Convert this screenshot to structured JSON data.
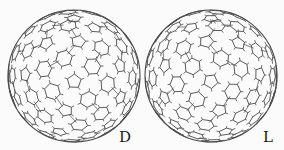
{
  "figure": {
    "background": "#fbfbfb",
    "line_color": "#4a4a4a",
    "spheres": [
      {
        "id": "d",
        "label": "D",
        "center_x": 74,
        "center_y": 76,
        "radius": 66,
        "mirrored": false,
        "label_x": 119,
        "label_y": 130
      },
      {
        "id": "l",
        "label": "L",
        "center_x": 211,
        "center_y": 76,
        "radius": 66,
        "mirrored": true,
        "label_x": 263,
        "label_y": 130
      }
    ]
  }
}
